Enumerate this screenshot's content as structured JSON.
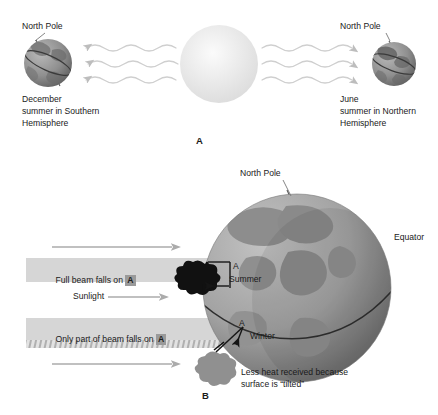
{
  "figure": {
    "panels": [
      {
        "id": "A",
        "letter": "A",
        "labels": {
          "north_pole_left": "North Pole",
          "north_pole_right": "North Pole",
          "december_line1": "December",
          "december_line2": "summer in Southern",
          "december_line3": "Hemisphere",
          "june_line1": "June",
          "june_line2": "summer in Northern",
          "june_line3": "Hemisphere"
        },
        "sun": {
          "name": "sun",
          "color": "#e8e8e8"
        },
        "rays": {
          "count_left": 3,
          "count_right": 3,
          "style": "wavy",
          "color": "#c9c9c9"
        }
      },
      {
        "id": "B",
        "letter": "B",
        "labels": {
          "north_pole": "North Pole",
          "equator": "Equator",
          "full_beam_pre": "Full beam falls on ",
          "full_beam_box": "A",
          "sunlight": "Sunlight",
          "partial_beam_pre": "Only part of beam falls on ",
          "partial_beam_box": "A",
          "summer_a": "A",
          "summer": "Summer",
          "winter_a": "A",
          "winter": "Winter",
          "caption_line1": "Less heat received because",
          "caption_line2": "surface is “tilted”"
        },
        "globe": {
          "name": "earth-globe",
          "ocean_color": "#a8a8a8",
          "land_color": "#8d8d8d"
        },
        "beams": {
          "band_color": "#d6d6d6",
          "hatch_color": "#b4b4b4",
          "arrow_color": "#a6a6a6"
        }
      }
    ]
  },
  "colors": {
    "background": "#ffffff",
    "text": "#1a1a1a",
    "ray": "#c9c9c9",
    "globe_light": "#b5b5b5",
    "globe_dark": "#6f6f6f",
    "a_box": "#9a9a9a"
  }
}
